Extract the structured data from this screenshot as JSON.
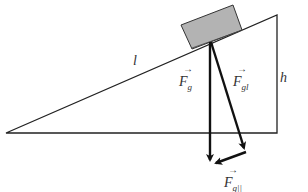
{
  "diagram": {
    "type": "inclined-plane-force-decomposition",
    "labels": {
      "length": "l",
      "height": "h",
      "gravity": {
        "main": "F",
        "sub": "g",
        "arrow": "→"
      },
      "perpendicular": {
        "main": "F",
        "sub": "gl",
        "arrow": "→"
      },
      "parallel": {
        "main": "F",
        "sub": "g||",
        "arrow": "→"
      }
    },
    "colors": {
      "line": "#222222",
      "block_fill": "#b3b3b3",
      "block_stroke": "#333333",
      "background": "#ffffff"
    }
  }
}
